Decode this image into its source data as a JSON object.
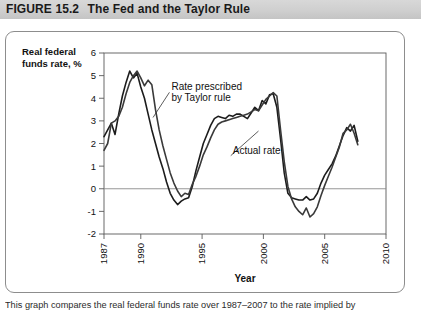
{
  "header": {
    "figure_label": "FIGURE",
    "figure_number": "15.2",
    "title": "The Fed and the Taylor Rule"
  },
  "caption": {
    "text": "This graph compares the real federal funds rate over 1987–2007 to the rate implied by"
  },
  "chart_data": {
    "type": "line",
    "title": "",
    "xlabel": "Year",
    "ylabel": "Real federal funds rate, %",
    "xlim": [
      1987,
      2010
    ],
    "ylim": [
      -2,
      6
    ],
    "yticks": [
      -2,
      -1,
      0,
      1,
      2,
      3,
      4,
      5,
      6
    ],
    "xticks": [
      1987,
      1990,
      1995,
      2000,
      2005,
      2010
    ],
    "xtick_labels": [
      "1987",
      "1990",
      "1995",
      "2000",
      "2005",
      "2010"
    ],
    "ytick_labels": [
      "-2",
      "-1",
      "0",
      "1",
      "2",
      "3",
      "4",
      "5",
      "6"
    ],
    "grid": false,
    "zero_line": 0,
    "legend": "annotations",
    "annotations": [
      {
        "name": "taylor-rule-annotation",
        "text_line1": "Rate prescribed",
        "text_line2": "by Taylor rule",
        "text_x": 1992.5,
        "text_y": 4.35,
        "leader_to_x": 1991.0,
        "leader_to_y": 3.15
      },
      {
        "name": "actual-rate-annotation",
        "text_line1": "Actual rate",
        "text_x": 1997.5,
        "text_y": 1.55,
        "leader_to_x": 1999.6,
        "leader_to_y": 2.55
      }
    ],
    "series": [
      {
        "name": "Rate prescribed by Taylor rule",
        "color": "#1c1c1c",
        "x": [
          1987.0,
          1987.3,
          1987.6,
          1987.9,
          1988.2,
          1988.5,
          1988.8,
          1989.1,
          1989.4,
          1989.7,
          1990.0,
          1990.3,
          1990.6,
          1990.9,
          1991.2,
          1991.5,
          1991.8,
          1992.1,
          1992.4,
          1992.7,
          1993.0,
          1993.3,
          1993.6,
          1993.9,
          1994.2,
          1994.5,
          1994.8,
          1995.1,
          1995.4,
          1995.7,
          1996.0,
          1996.3,
          1996.6,
          1996.9,
          1997.2,
          1997.5,
          1997.8,
          1998.1,
          1998.4,
          1998.7,
          1999.0,
          1999.3,
          1999.6,
          1999.9,
          2000.2,
          2000.5,
          2000.8,
          2001.1,
          2001.4,
          2001.7,
          2002.0,
          2002.3,
          2002.6,
          2002.9,
          2003.2,
          2003.5,
          2003.8,
          2004.1,
          2004.4,
          2004.7,
          2005.0,
          2005.3,
          2005.6,
          2005.9,
          2006.2,
          2006.5,
          2006.8,
          2007.1,
          2007.4,
          2007.7
        ],
        "y": [
          2.3,
          2.6,
          2.9,
          2.4,
          3.3,
          4.1,
          4.7,
          5.2,
          4.9,
          5.1,
          4.5,
          4.0,
          3.3,
          2.6,
          2.0,
          1.4,
          0.9,
          0.3,
          -0.2,
          -0.5,
          -0.7,
          -0.55,
          -0.45,
          -0.4,
          0.1,
          0.8,
          1.4,
          2.0,
          2.4,
          2.8,
          3.1,
          3.2,
          3.15,
          3.1,
          3.25,
          3.2,
          3.3,
          3.3,
          3.2,
          3.1,
          3.35,
          3.6,
          3.45,
          3.9,
          3.75,
          4.15,
          4.2,
          3.6,
          2.2,
          0.7,
          -0.2,
          -0.4,
          -0.45,
          -0.5,
          -0.5,
          -0.35,
          -0.5,
          -0.45,
          -0.2,
          0.25,
          0.6,
          0.85,
          1.1,
          1.45,
          1.9,
          2.35,
          2.7,
          2.55,
          2.8,
          2.1
        ],
        "width": 1.6
      },
      {
        "name": "Actual rate",
        "color": "#3a3a3a",
        "x": [
          1987.0,
          1987.3,
          1987.6,
          1987.9,
          1988.2,
          1988.5,
          1988.8,
          1989.1,
          1989.4,
          1989.7,
          1990.0,
          1990.3,
          1990.6,
          1990.9,
          1991.2,
          1991.5,
          1991.8,
          1992.1,
          1992.4,
          1992.7,
          1993.0,
          1993.3,
          1993.6,
          1993.9,
          1994.2,
          1994.5,
          1994.8,
          1995.1,
          1995.4,
          1995.7,
          1996.0,
          1996.3,
          1996.6,
          1996.9,
          1997.2,
          1997.5,
          1997.8,
          1998.1,
          1998.4,
          1998.7,
          1999.0,
          1999.3,
          1999.6,
          1999.9,
          2000.2,
          2000.5,
          2000.8,
          2001.1,
          2001.4,
          2001.7,
          2002.0,
          2002.3,
          2002.6,
          2002.9,
          2003.2,
          2003.5,
          2003.8,
          2004.1,
          2004.4,
          2004.7,
          2005.0,
          2005.3,
          2005.6,
          2005.9,
          2006.2,
          2006.5,
          2006.8,
          2007.1,
          2007.4,
          2007.7
        ],
        "y": [
          1.7,
          2.0,
          2.9,
          3.0,
          3.2,
          3.6,
          4.2,
          4.7,
          5.0,
          5.2,
          4.9,
          4.55,
          4.8,
          4.6,
          3.5,
          2.6,
          1.9,
          1.3,
          0.7,
          0.25,
          -0.1,
          -0.35,
          -0.2,
          -0.25,
          0.2,
          0.55,
          1.0,
          1.5,
          1.85,
          2.25,
          2.6,
          2.85,
          2.95,
          3.0,
          3.05,
          3.1,
          3.15,
          3.2,
          3.25,
          3.3,
          3.4,
          3.5,
          3.45,
          3.7,
          3.95,
          4.1,
          4.25,
          4.1,
          2.6,
          1.2,
          0.1,
          -0.45,
          -0.8,
          -1.0,
          -1.15,
          -0.85,
          -1.25,
          -1.1,
          -0.8,
          -0.3,
          0.15,
          0.55,
          0.95,
          1.4,
          1.85,
          2.45,
          2.6,
          2.85,
          2.45,
          1.95
        ],
        "width": 1.6
      }
    ]
  }
}
